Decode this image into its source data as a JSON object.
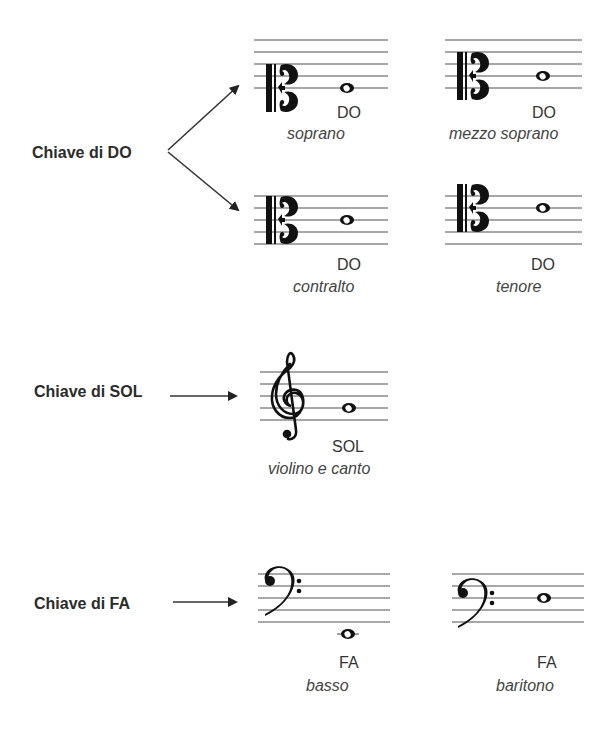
{
  "colors": {
    "text": "#2b2b2b",
    "staff": "#8a8a8a",
    "ink": "#111111"
  },
  "groups": [
    {
      "id": "do",
      "label": "Chiave di DO",
      "icon": "c-clef-icon",
      "staves": [
        {
          "voice": "soprano",
          "note": "DO",
          "clef_line": 1,
          "note_line": 1
        },
        {
          "voice": "mezzo soprano",
          "note": "DO",
          "clef_line": 2,
          "note_line": 2
        },
        {
          "voice": "contralto",
          "note": "DO",
          "clef_line": 3,
          "note_line": 3
        },
        {
          "voice": "tenore",
          "note": "DO",
          "clef_line": 4,
          "note_line": 4
        }
      ]
    },
    {
      "id": "sol",
      "label": "Chiave di SOL",
      "icon": "treble-clef-icon",
      "staves": [
        {
          "voice": "violino e canto",
          "note": "SOL",
          "clef_line": 2,
          "note_line": 2
        }
      ]
    },
    {
      "id": "fa",
      "label": "Chiave di FA",
      "icon": "bass-clef-icon",
      "staves": [
        {
          "voice": "basso",
          "note": "FA",
          "clef_line": 4,
          "note_position": "below staff"
        },
        {
          "voice": "baritono",
          "note": "FA",
          "clef_line": 3,
          "note_line": 3
        }
      ]
    }
  ]
}
